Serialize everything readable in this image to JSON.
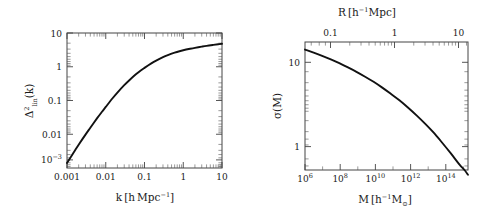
{
  "figure": {
    "background_color": "#ffffff",
    "curve_color": "#111111",
    "axis_color": "#444444",
    "panels": [
      "left",
      "right"
    ]
  },
  "left_panel": {
    "xlabel_main": "k",
    "xlabel_bracket_open": "[",
    "xlabel_h": "h",
    "xlabel_mpc": "Mpc",
    "xlabel_exp": "−1",
    "xlabel_bracket_close": "]",
    "ylabel_delta": "Δ",
    "ylabel_sup": "2",
    "ylabel_sub": "lin",
    "ylabel_arg": "(k)",
    "xticks": [
      "0.001",
      "0.01",
      "0.1",
      "1",
      "10"
    ],
    "yticks": [
      "10",
      "1",
      "0.1",
      "0.01",
      "10"
    ],
    "ytick_last_exp": "−3"
  },
  "right_panel": {
    "xlabel_main": "M",
    "xlabel_bracket_open": "[",
    "xlabel_h": "h",
    "xlabel_h_exp": "−1",
    "xlabel_m": "M",
    "xlabel_m_sub": "⊙",
    "xlabel_bracket_close": "]",
    "toplabel_main": "R",
    "toplabel_bracket_open": "[",
    "toplabel_h": "h",
    "toplabel_h_exp": "−1",
    "toplabel_mpc": "Mpc",
    "toplabel_bracket_close": "]",
    "ylabel": "σ(M)",
    "xtick_bases": [
      "10",
      "10",
      "10",
      "10",
      "10"
    ],
    "xtick_exps": [
      "6",
      "8",
      "10",
      "12",
      "14"
    ],
    "topticks": [
      "0.1",
      "1",
      "10"
    ],
    "yticks": [
      "10",
      "1"
    ]
  },
  "chart_data": [
    {
      "type": "line",
      "panel": "left",
      "title": "",
      "xlabel": "k [h Mpc^-1]",
      "ylabel": "Delta^2_lin(k)",
      "xscale": "log",
      "yscale": "log",
      "xlim": [
        0.001,
        10
      ],
      "ylim": [
        0.0004,
        10
      ],
      "xticks": [
        0.001,
        0.01,
        0.1,
        1,
        10
      ],
      "yticks": [
        0.001,
        0.01,
        0.1,
        1,
        10
      ],
      "grid": false,
      "legend": null,
      "series": [
        {
          "name": "Delta^2_lin",
          "x": [
            0.001,
            0.0015,
            0.002,
            0.003,
            0.004,
            0.006,
            0.008,
            0.01,
            0.015,
            0.02,
            0.03,
            0.04,
            0.06,
            0.08,
            0.1,
            0.15,
            0.2,
            0.3,
            0.4,
            0.6,
            0.8,
            1.0,
            1.5,
            2.0,
            3.0,
            4.0,
            6.0,
            8.0,
            10.0
          ],
          "y": [
            0.00058,
            0.0013,
            0.0023,
            0.0049,
            0.0082,
            0.0168,
            0.0272,
            0.039,
            0.075,
            0.115,
            0.2,
            0.285,
            0.45,
            0.6,
            0.73,
            1.02,
            1.26,
            1.63,
            1.9,
            2.28,
            2.55,
            2.74,
            3.06,
            3.29,
            3.6,
            3.82,
            4.1,
            4.3,
            4.45
          ]
        }
      ]
    },
    {
      "type": "line",
      "panel": "right",
      "title": "",
      "xlabel": "M [h^-1 M_sun]",
      "ylabel": "sigma(M)",
      "top_axis_label": "R [h^-1 Mpc]",
      "xscale": "log",
      "yscale": "log",
      "xlim": [
        1000000.0,
        3200000000000000.0
      ],
      "ylim": [
        0.55,
        12
      ],
      "xticks": [
        1000000.0,
        100000000.0,
        10000000000.0,
        1000000000000.0,
        100000000000000.0
      ],
      "top_xticks": [
        0.1,
        1,
        10
      ],
      "yticks": [
        1,
        10
      ],
      "grid": false,
      "legend": null,
      "series": [
        {
          "name": "sigma(M)",
          "x": [
            1000000.0,
            3200000.0,
            10000000.0,
            32000000.0,
            100000000.0,
            320000000.0,
            1000000000.0,
            3200000000.0,
            10000000000.0,
            32000000000.0,
            100000000000.0,
            320000000000.0,
            1000000000000.0,
            3200000000000.0,
            10000000000000.0,
            32000000000000.0,
            100000000000000.0,
            320000000000000.0,
            1000000000000000.0,
            2000000000000000.0,
            3200000000000000.0
          ],
          "y": [
            10.0,
            9.3,
            8.6,
            7.9,
            7.2,
            6.5,
            5.85,
            5.2,
            4.6,
            4.0,
            3.45,
            2.95,
            2.48,
            2.05,
            1.68,
            1.35,
            1.06,
            0.82,
            0.63,
            0.55,
            0.49
          ]
        }
      ]
    }
  ]
}
